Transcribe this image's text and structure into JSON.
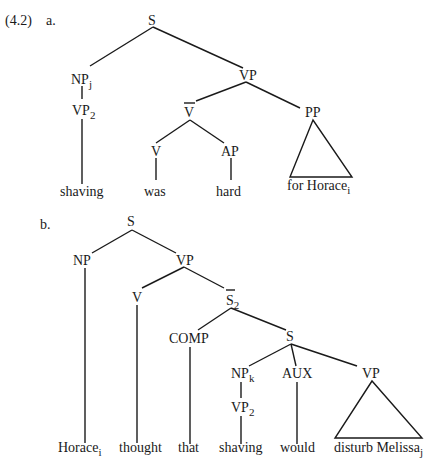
{
  "example_number": "(4.2)",
  "tree_a": {
    "label": "a.",
    "nodes": {
      "S": "S",
      "NP": "NP",
      "NP_sub": "j",
      "VP2": "VP",
      "VP2_sub": "2",
      "VP": "VP",
      "Vbar": "V",
      "V": "V",
      "AP": "AP",
      "PP": "PP"
    },
    "leaves": {
      "shaving": "shaving",
      "was": "was",
      "hard": "hard",
      "for_horace": "for Horace",
      "for_horace_sub": "i"
    }
  },
  "tree_b": {
    "label": "b.",
    "nodes": {
      "S": "S",
      "NP": "NP",
      "VP": "VP",
      "V": "V",
      "Sbar": "S",
      "Sbar_sub": "2",
      "COMP": "COMP",
      "S2": "S",
      "NPk": "NP",
      "NPk_sub": "k",
      "VP2": "VP",
      "VP2_sub": "2",
      "AUX": "AUX",
      "VP3": "VP"
    },
    "leaves": {
      "horace": "Horace",
      "horace_sub": "i",
      "thought": "thought",
      "that": "that",
      "shaving": "shaving",
      "would": "would",
      "disturb": "disturb Melissa",
      "disturb_sub": "j"
    }
  }
}
